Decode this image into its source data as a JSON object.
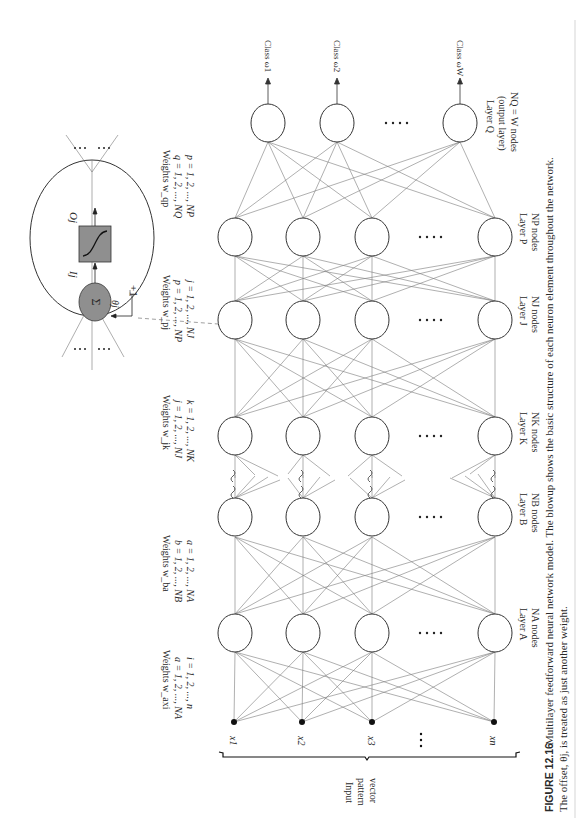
{
  "figure": {
    "label": "FIGURE 12.16",
    "caption_line1": "Multilayer feedforward neural network model. The blowup shows the basic structure of each neuron element throughout the network.",
    "caption_line2": "The offset, θj, is treated as just another weight."
  },
  "input": {
    "label_line1": "Input",
    "label_line2": "pattern",
    "label_line3": "vector",
    "nodes": [
      "x1",
      "x2",
      "x3",
      "xn"
    ],
    "ellipsis": "· · ·"
  },
  "layers": [
    {
      "id": "A",
      "name": "Layer A",
      "count": "NA nodes"
    },
    {
      "id": "B",
      "name": "Layer B",
      "count": "NB nodes"
    },
    {
      "id": "K",
      "name": "Layer K",
      "count": "NK nodes"
    },
    {
      "id": "J",
      "name": "Layer J",
      "count": "NJ nodes"
    },
    {
      "id": "P",
      "name": "Layer P",
      "count": "NP nodes"
    },
    {
      "id": "Q",
      "name": "Layer Q",
      "sub": "(output layer)",
      "count": "NQ = W nodes"
    }
  ],
  "weights": [
    {
      "title": "Weights w_axi",
      "line1": "a = 1, 2, ..., NA",
      "line2": "i = 1, 2, ..., n"
    },
    {
      "title": "Weights w_ba",
      "line1": "b = 1, 2, ..., NB",
      "line2": "a = 1, 2, ..., NA"
    },
    {
      "title": "Weights w_jk",
      "line1": "j = 1, 2, ..., NJ",
      "line2": "k = 1, 2, ..., NK"
    },
    {
      "title": "Weights w_pj",
      "line1": "p = 1, 2, ..., NP",
      "line2": "j = 1, 2, ..., NJ"
    },
    {
      "title": "Weights w_qp",
      "line1": "q = 1, 2, ..., NQ",
      "line2": "p = 1, 2, ..., NP"
    }
  ],
  "outputs": [
    "Class ω1",
    "Class ω2",
    "Class ωW"
  ],
  "blowup": {
    "sum_symbol": "Σ",
    "input_label": "Ij",
    "output_label": "Oj",
    "theta_label": "θj",
    "bias_label": "+1"
  },
  "colors": {
    "node_fill_gray": "#8f8f8f",
    "line": "#6a6a6a",
    "stroke": "#333333"
  }
}
